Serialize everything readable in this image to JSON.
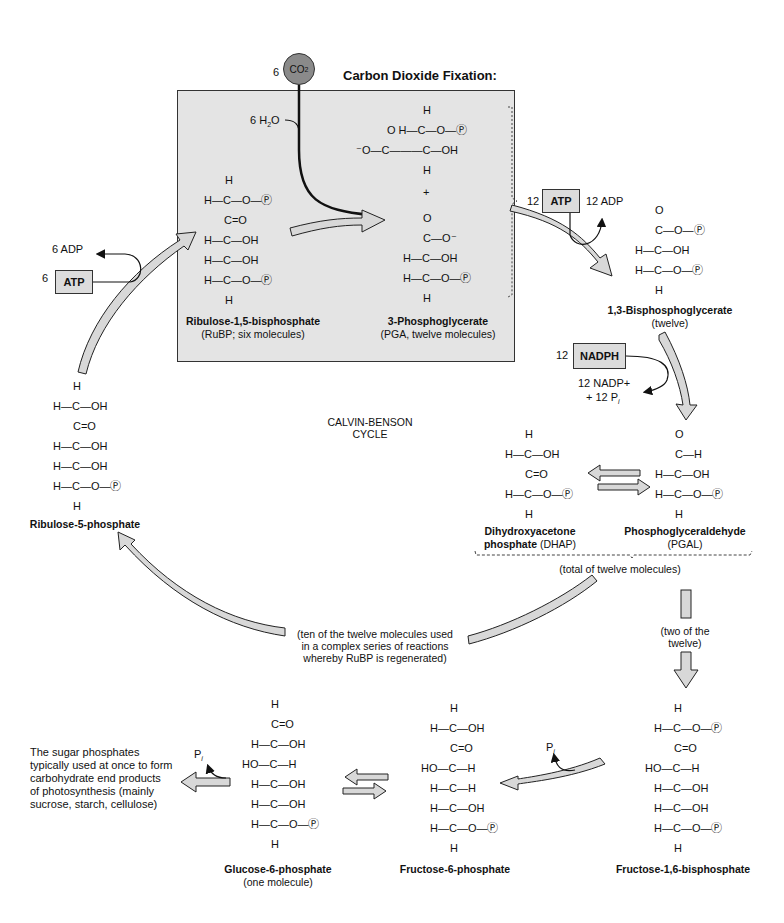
{
  "title": "Carbon Dioxide Fixation:",
  "cycle_label": [
    "CALVIN-BENSON",
    "CYCLE"
  ],
  "co2": {
    "coef": "6",
    "label": "CO",
    "sub": "2"
  },
  "water": {
    "label": "6 H",
    "sub": "2",
    "tail": "O"
  },
  "atp_left": {
    "coef": "6",
    "box": "ATP",
    "product": "6 ADP"
  },
  "atp_right": {
    "coef": "12",
    "box": "ATP",
    "product": "12 ADP"
  },
  "nadph": {
    "coef": "12",
    "box": "NADPH",
    "product_line1": "12 NADP+",
    "product_line2": "+ 12 P",
    "product_line2_sub": "i"
  },
  "molecules": {
    "rubp": {
      "name": "Ribulose-1,5-bisphosphate",
      "note": "(RuBP; six molecules)"
    },
    "pga": {
      "name": "3-Phosphoglycerate",
      "note": "(PGA, twelve molecules)"
    },
    "bpg": {
      "name": "1,3-Bisphosphoglycerate",
      "note": "(twelve)"
    },
    "dhap": {
      "name": "Dihydroxyacetone",
      "name2": "phosphate",
      "note": "(DHAP)"
    },
    "pgal": {
      "name": "Phosphoglyceraldehyde",
      "note": "(PGAL)"
    },
    "ru5p": {
      "name": "Ribulose-5-phosphate"
    },
    "fbp": {
      "name": "Fructose-1,6-bisphosphate"
    },
    "f6p": {
      "name": "Fructose-6-phosphate"
    },
    "g6p": {
      "name": "Glucose-6-phosphate",
      "note": "(one molecule)"
    }
  },
  "notes": {
    "total": "(total of twelve molecules)",
    "ten": [
      "(ten of the twelve molecules used",
      "in a complex series of reactions",
      "whereby RuBP is regenerated)"
    ],
    "two": [
      "(two of the",
      "twelve)"
    ],
    "end_products": [
      "The sugar phosphates",
      "typically used at once to form",
      "carbohydrate end products",
      "of photosynthesis (mainly",
      "sucrose, starch, cellulose)"
    ],
    "pi_f": "P",
    "pi_g": "P",
    "pi_sub": "i"
  },
  "colors": {
    "box_fill": "#e4e4e4",
    "arrow_fill": "#d8d8d8",
    "co2_fill": "#8a8a8a",
    "stroke": "#222222"
  }
}
